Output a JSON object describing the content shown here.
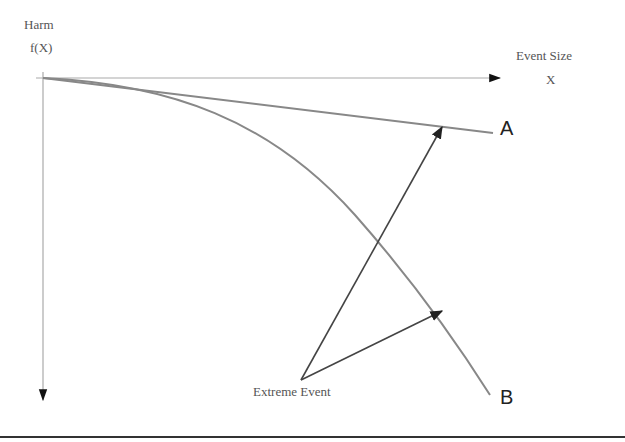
{
  "diagram": {
    "y_axis": {
      "label_line1": "Harm",
      "label_line2": "f(X)"
    },
    "x_axis": {
      "label_line1": "Event Size",
      "label_line2": "X"
    },
    "curves": [
      {
        "id": "A",
        "label": "A",
        "shape": "near-linear, slowly declining harm"
      },
      {
        "id": "B",
        "label": "B",
        "shape": "concave, accelerating harm"
      }
    ],
    "annotation": {
      "label": "Extreme Event",
      "points_to": [
        "A",
        "B"
      ]
    },
    "colors": {
      "axis": "#999999",
      "curve": "#888888",
      "arrow": "#444444",
      "text": "#555555",
      "rule": "#333333"
    }
  }
}
